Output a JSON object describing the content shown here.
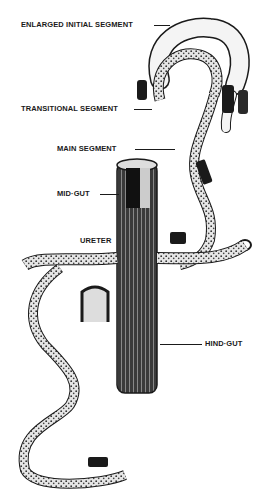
{
  "figure": {
    "labels": {
      "enlarged_initial_segment": "ENLARGED INITIAL SEGMENT",
      "transitional_segment": "TRANSITIONAL SEGMENT",
      "main_segment": "MAIN SEGMENT",
      "mid_gut": "MID·GUT",
      "ureter": "URETER",
      "hind_gut": "HIND·GUT"
    },
    "colors": {
      "ink": "#1a1a1a",
      "paper": "#ffffff",
      "stipple": "#9a9a9a"
    }
  }
}
